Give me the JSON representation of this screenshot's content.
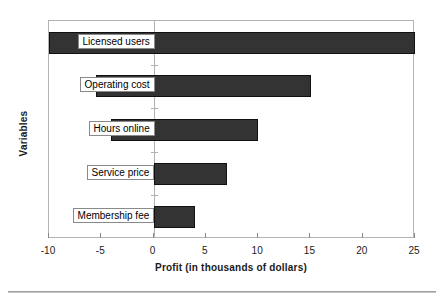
{
  "chart_data": {
    "type": "bar",
    "orientation": "horizontal",
    "title": "",
    "xlabel": "Profit (in thousands of dollars)",
    "ylabel": "Variables",
    "xlim": [
      -10,
      25
    ],
    "xticks": [
      -10,
      -5,
      0,
      5,
      10,
      15,
      20,
      25
    ],
    "xticklabels": [
      "-10",
      "-5",
      "0",
      "5",
      "10",
      "15",
      "20",
      "25"
    ],
    "grid": false,
    "legend": null,
    "categories": [
      "Licensed users",
      "Operating cost",
      "Hours online",
      "Service price",
      "Membership fee"
    ],
    "bars": [
      {
        "category": "Licensed users",
        "low": -10.0,
        "high": 25.0
      },
      {
        "category": "Operating cost",
        "low": -5.5,
        "high": 15.1
      },
      {
        "category": "Hours online",
        "low": -4.1,
        "high": 10.0
      },
      {
        "category": "Service price",
        "low": 0.0,
        "high": 7.0
      },
      {
        "category": "Membership fee",
        "low": 0.0,
        "high": 4.0
      }
    ],
    "colors": {
      "bar_fill": "#333333",
      "bar_edge": "#111111",
      "axis": "#b4b4b4",
      "text": "#1a1a1a",
      "background": "#ffffff"
    }
  }
}
